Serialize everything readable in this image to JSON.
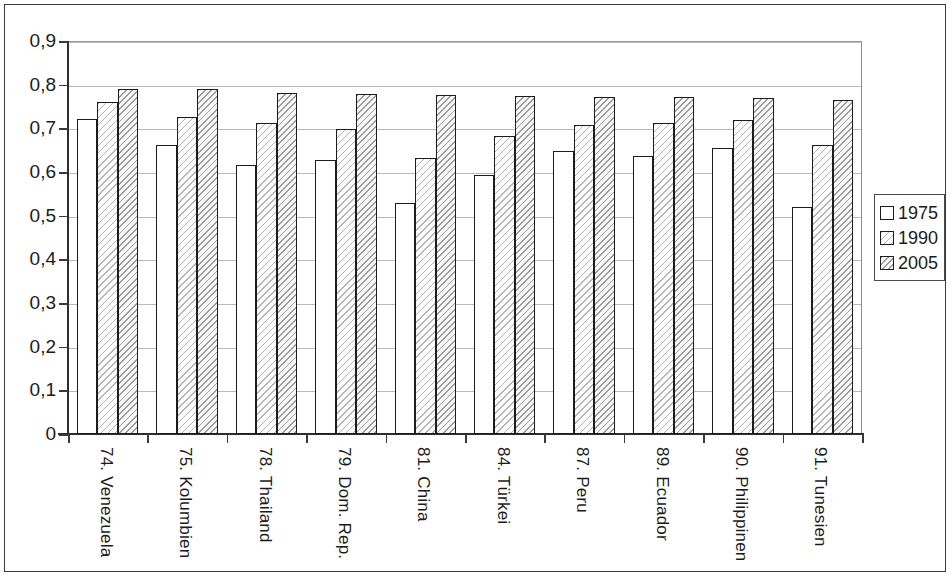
{
  "chart_data": {
    "type": "bar",
    "title": "",
    "xlabel": "",
    "ylabel": "",
    "ylim": [
      0,
      0.9
    ],
    "grid": true,
    "legend_position": "right",
    "categories": [
      "74. Venezuela",
      "75. Kolumbien",
      "78. Thailand",
      "79. Dom. Rep.",
      "81. China",
      "84. Türkei",
      "87. Peru",
      "89. Ecuador",
      "90. Philippinen",
      "91. Tunesien"
    ],
    "ytick_labels": [
      "0",
      "0,1",
      "0,2",
      "0,3",
      "0,4",
      "0,5",
      "0,6",
      "0,7",
      "0,8",
      "0,9"
    ],
    "ytick_values": [
      0,
      0.1,
      0.2,
      0.3,
      0.4,
      0.5,
      0.6,
      0.7,
      0.8,
      0.9
    ],
    "series": [
      {
        "name": "1975",
        "fill": "white",
        "values": [
          0.722,
          0.662,
          0.615,
          0.628,
          0.528,
          0.593,
          0.647,
          0.637,
          0.655,
          0.52
        ]
      },
      {
        "name": "1990",
        "fill": "light-hatch",
        "values": [
          0.76,
          0.727,
          0.712,
          0.698,
          0.633,
          0.683,
          0.708,
          0.713,
          0.72,
          0.662
        ]
      },
      {
        "name": "2005",
        "fill": "dark-hatch",
        "values": [
          0.791,
          0.791,
          0.78,
          0.779,
          0.777,
          0.775,
          0.772,
          0.771,
          0.77,
          0.765
        ]
      }
    ]
  },
  "legend": {
    "items": [
      {
        "label": "1975"
      },
      {
        "label": "1990"
      },
      {
        "label": "2005"
      }
    ]
  },
  "colors": {
    "axis": "#2e2e2e",
    "grid": "#b9b9b9",
    "bar_outline": "#1c1c1c",
    "text": "#1b1b1b",
    "frame": "#3a3a3a"
  }
}
